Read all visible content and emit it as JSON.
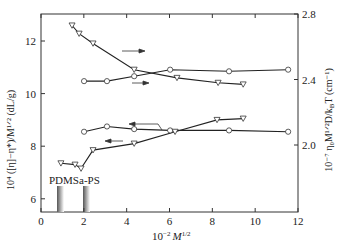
{
  "chart_data": {
    "type": "line",
    "title": "",
    "xlabel": "10⁻² M¹ᐟ²",
    "xlabel_parts": {
      "prefix": "10",
      "exp1": "−2",
      "var": "M",
      "exp2": "1/2"
    },
    "ylabel_left": "10⁴ ([η]−η*)/M¹ᐟ² (dL/g)",
    "ylabel_right": "10⁻⁷ η₀M¹ᐟ²D/k_BT (cm⁻¹)",
    "xlim": [
      0,
      12
    ],
    "ylim_left": [
      5.6,
      13.0
    ],
    "ylim_right": [
      1.6,
      2.8
    ],
    "x_ticks": [
      "0",
      "2",
      "4",
      "6",
      "8",
      "10",
      "12"
    ],
    "y_left_ticks": [
      "6",
      "8",
      "10",
      "12"
    ],
    "y_right_ticks": [
      "2.0",
      "2.4",
      "2.8"
    ],
    "grid": false,
    "annotations": [
      {
        "text": "PDMS",
        "x": 0.75,
        "type": "bar-marker"
      },
      {
        "text": "a-PS",
        "x": 1.95,
        "type": "bar-marker"
      }
    ],
    "series": [
      {
        "name": "triangles-upper (right axis)",
        "marker": "triangle-down",
        "axis": "right",
        "x": [
          1.45,
          1.78,
          2.43,
          4.35,
          6.35,
          8.27,
          9.44
        ],
        "y": [
          2.73,
          2.68,
          2.62,
          2.46,
          2.41,
          2.38,
          2.37
        ]
      },
      {
        "name": "circles-upper (right axis)",
        "marker": "circle",
        "axis": "right",
        "x": [
          2.01,
          3.08,
          4.35,
          6.03,
          8.78,
          11.54
        ],
        "y": [
          2.39,
          2.39,
          2.42,
          2.46,
          2.45,
          2.46
        ]
      },
      {
        "name": "circles-lower (left axis)",
        "marker": "circle",
        "axis": "left",
        "x": [
          2.01,
          3.08,
          4.35,
          6.03,
          8.78,
          11.54
        ],
        "y": [
          8.55,
          8.75,
          8.65,
          8.6,
          8.6,
          8.55
        ]
      },
      {
        "name": "triangles-lower (left axis)",
        "marker": "triangle-down",
        "axis": "left",
        "x": [
          0.93,
          1.59,
          1.87,
          2.43,
          4.35,
          6.26,
          8.22,
          9.44
        ],
        "y": [
          7.35,
          7.3,
          7.15,
          7.85,
          8.1,
          8.55,
          9.0,
          9.05
        ]
      }
    ]
  }
}
